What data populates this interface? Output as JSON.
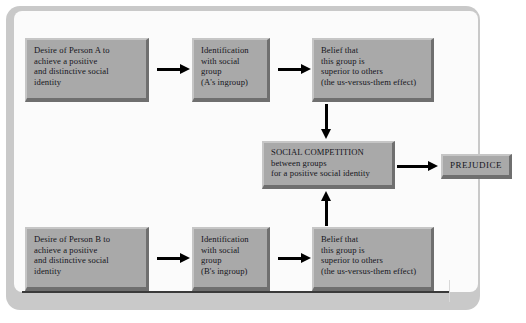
{
  "diagram": {
    "title_hidden": "",
    "boxes": {
      "desire_a": {
        "lines": [
          "Desire of Person A to",
          "achieve a positive",
          "and distinctive social",
          "identity"
        ]
      },
      "identification_a": {
        "lines": [
          "Identification",
          "with social",
          "group",
          "(A's ingroup)"
        ]
      },
      "belief_a": {
        "lines": [
          "Belief that",
          "this group is",
          "superior to others",
          "(the us-versus-them effect)"
        ]
      },
      "desire_b": {
        "lines": [
          "Desire of Person B to",
          "achieve a positive",
          "and distinctive social",
          "identity"
        ]
      },
      "identification_b": {
        "lines": [
          "Identification",
          "with social",
          "group",
          "(B's ingroup)"
        ]
      },
      "belief_b": {
        "lines": [
          "Belief that",
          "this group is",
          "superior to others",
          "(the us-versus-them effect)"
        ]
      },
      "social_competition": {
        "lines": [
          "SOCIAL COMPETITION",
          "between groups",
          "for a positive social identity"
        ]
      },
      "prejudice": {
        "label": "PREJUDICE"
      }
    },
    "colors": {
      "box_fill": "#a9a9a9",
      "box_highlight": "#c6c6c6",
      "box_shadow": "#6f6f6f",
      "arrow": "#000000",
      "frame_border": "#c9c9c9",
      "frame_interior": "#fbfbfb",
      "text": "#15151c"
    }
  }
}
